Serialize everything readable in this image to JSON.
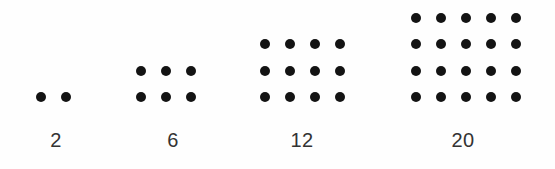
{
  "figure": {
    "title": "",
    "background_color": "#fefefe",
    "dot_color": "#131313",
    "label_color": "#333333"
  },
  "chart_data": {
    "type": "scatter",
    "title": "",
    "subtitle": "",
    "xlabel": "",
    "ylabel": "",
    "legend": [],
    "grid": false,
    "categories": [
      "2",
      "6",
      "12",
      "20"
    ],
    "values": [
      2,
      6,
      12,
      20
    ],
    "series": [
      {
        "name": "dot count",
        "values": [
          2,
          6,
          12,
          20
        ]
      },
      {
        "name": "rows",
        "values": [
          1,
          2,
          3,
          4
        ]
      },
      {
        "name": "columns",
        "values": [
          2,
          3,
          4,
          5
        ]
      }
    ],
    "groups": [
      {
        "label": "2",
        "rows": 1,
        "cols": 2,
        "total": 2
      },
      {
        "label": "6",
        "rows": 2,
        "cols": 3,
        "total": 6
      },
      {
        "label": "12",
        "rows": 3,
        "cols": 4,
        "total": 12
      },
      {
        "label": "20",
        "rows": 4,
        "cols": 5,
        "total": 20
      }
    ]
  },
  "labels": {
    "group_0": "2",
    "group_1": "6",
    "group_2": "12",
    "group_3": "20"
  }
}
